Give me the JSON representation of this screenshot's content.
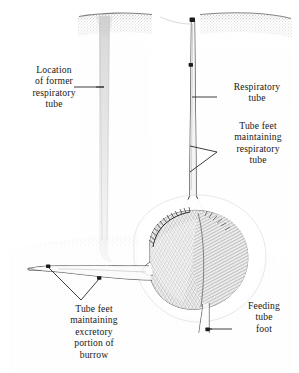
{
  "figure": {
    "width": 299,
    "height": 373,
    "background_color": "#ffffff",
    "ink_color": "#181818",
    "sediment_color": "#9a9a9a"
  },
  "labels": {
    "former_respiratory_tube": "Location\nof former\nrespiratory\ntube",
    "respiratory_tube": "Respiratory\ntube",
    "tube_feet_respiratory": "Tube feet\nmaintaining\nrespiratory\ntube",
    "tube_feet_excretory": "Tube feet\nmaintaining\nexcretory\nportion of\nburrow",
    "feeding_tube_foot": "Feeding\ntube\nfoot"
  },
  "diagram_parts": {
    "sediment_surface": "stippled-sediment-surface",
    "former_burrow_shaft": "abandoned-vertical-shaft",
    "active_respiratory_tube": "active-vertical-respiratory-tube",
    "funnel_depression": "surface-funnel-depression",
    "urchin_body": "heart-urchin-body",
    "spine_fringe": "dorsal-spine-fringe",
    "excretory_burrow": "horizontal-excretory-burrow",
    "feeding_tube": "ventral-feeding-tube",
    "tube_foot_dots": 5
  }
}
